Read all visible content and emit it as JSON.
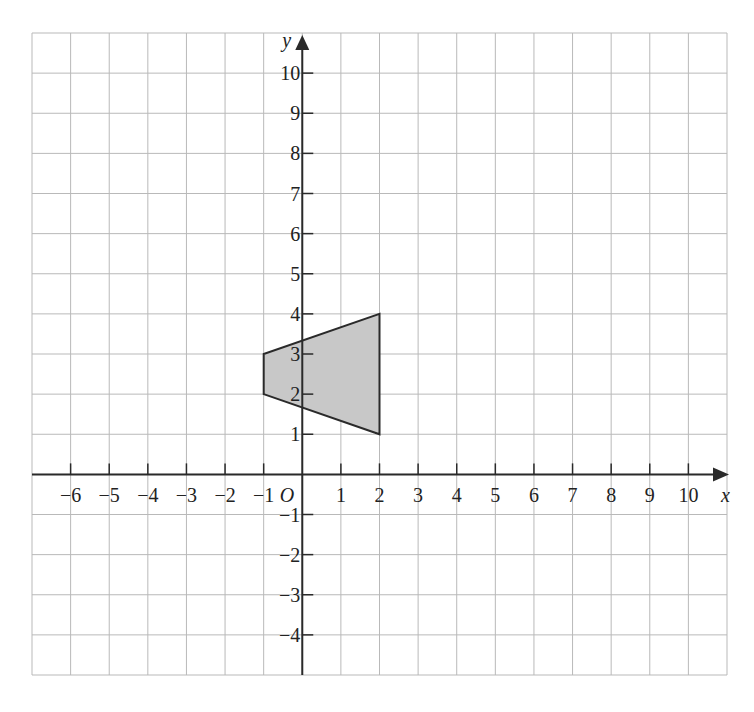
{
  "figure": {
    "type": "coordinate-grid-with-shape",
    "grid": {
      "x_min": -7,
      "x_max": 11,
      "y_min": -5,
      "y_max": 11,
      "grid_color": "#b9b9b9",
      "axis_color": "#2a2a2a"
    },
    "axes": {
      "x_label": "x",
      "y_label": "y",
      "origin_label": "O",
      "x_ticks": [
        -6,
        -5,
        -4,
        -3,
        -2,
        -1,
        1,
        2,
        3,
        4,
        5,
        6,
        7,
        8,
        9,
        10
      ],
      "x_tick_labels": [
        "−6",
        "−5",
        "−4",
        "−3",
        "−2",
        "−1",
        "1",
        "2",
        "3",
        "4",
        "5",
        "6",
        "7",
        "8",
        "9",
        "10"
      ],
      "y_ticks": [
        10,
        9,
        8,
        7,
        6,
        5,
        4,
        3,
        2,
        1,
        -1,
        -2,
        -3,
        -4
      ],
      "y_tick_labels": [
        "10",
        "9",
        "8",
        "7",
        "6",
        "5",
        "4",
        "3",
        "2",
        "1",
        "−1",
        "−2",
        "−3",
        "−4"
      ]
    },
    "shape": {
      "name": "trapezium",
      "vertices": [
        [
          -1,
          2
        ],
        [
          -1,
          3
        ],
        [
          2,
          4
        ],
        [
          2,
          1
        ]
      ],
      "fill": "#c8c8c8",
      "stroke": "#2a2a2a"
    }
  }
}
